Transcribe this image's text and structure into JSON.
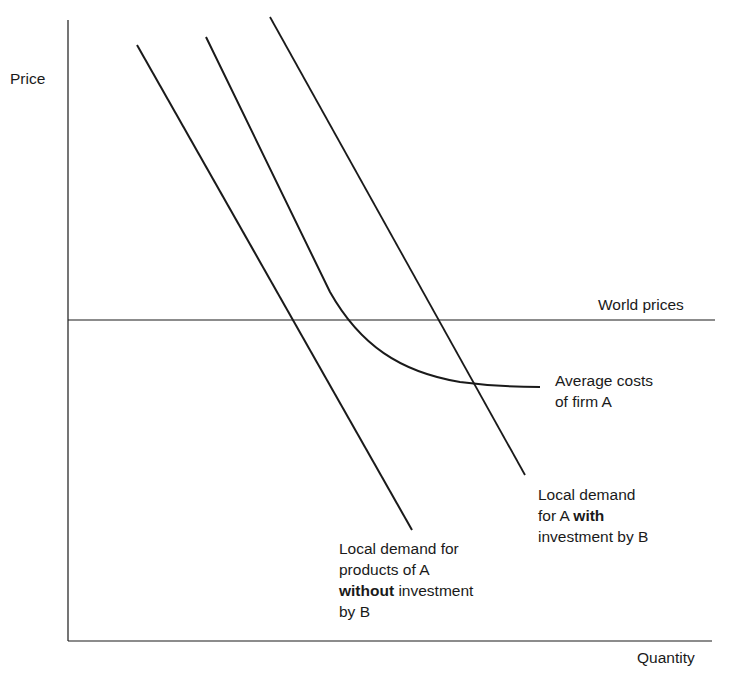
{
  "diagram": {
    "axes": {
      "y_label": "Price",
      "x_label": "Quantity"
    },
    "lines": {
      "world_prices": "World prices",
      "average_costs": {
        "line1": "Average costs",
        "line2": "of firm A"
      },
      "demand_with": {
        "line1": "Local demand",
        "line2_prefix": "for A ",
        "line2_bold": "with",
        "line3": "investment by B"
      },
      "demand_without": {
        "line1": "Local demand for",
        "line2": "products of A",
        "line3_bold": "without",
        "line3_suffix": " investment",
        "line4": "by B"
      }
    },
    "colors": {
      "line": "#1a1a1a",
      "background": "#ffffff"
    }
  }
}
